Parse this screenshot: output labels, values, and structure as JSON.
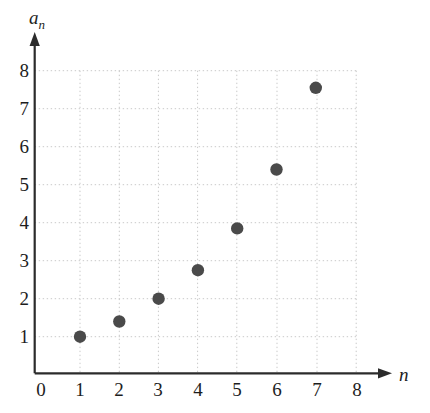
{
  "chart_data": {
    "type": "scatter",
    "title": "",
    "xlabel": "n",
    "ylabel": "a_n",
    "ylabel_base": "a",
    "ylabel_sub": "n",
    "x": [
      1,
      2,
      3,
      4,
      5,
      6,
      7
    ],
    "values": [
      1.0,
      1.4,
      2.0,
      2.75,
      3.85,
      5.4,
      7.55
    ],
    "points": [
      {
        "n": 1,
        "a": 1.0
      },
      {
        "n": 2,
        "a": 1.4
      },
      {
        "n": 3,
        "a": 2.0
      },
      {
        "n": 4,
        "a": 2.75
      },
      {
        "n": 5,
        "a": 3.85
      },
      {
        "n": 6,
        "a": 5.4
      },
      {
        "n": 7,
        "a": 7.55
      }
    ],
    "xlim": [
      0,
      8
    ],
    "ylim": [
      0,
      8
    ],
    "xticks": [
      "0",
      "1",
      "2",
      "3",
      "4",
      "5",
      "6",
      "7",
      "8"
    ],
    "yticks": [
      "8",
      "7",
      "6",
      "5",
      "4",
      "3",
      "2",
      "1"
    ],
    "grid": true,
    "grid_style": "dotted",
    "legend": "none",
    "marker": "filled-circle",
    "marker_color": "#4a4a4a",
    "grid_color": "#c9c9c9",
    "axis_color": "#2b2b2b",
    "background_color": "#ffffff",
    "axis_arrows": true
  }
}
